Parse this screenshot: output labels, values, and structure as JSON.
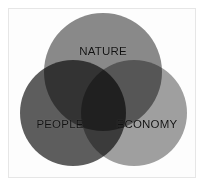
{
  "figure": {
    "background_color": "#ffffff",
    "frame_color": "#e6e6e6",
    "label_color": "#111111"
  },
  "chart_data": {
    "type": "venn",
    "title": "",
    "subtitle": "",
    "xlabel": "",
    "ylabel": "",
    "grid": false,
    "legend": "none",
    "set_count": 3,
    "blend_mode": "multiply",
    "sets": [
      {
        "id": "nature",
        "label": "NATURE",
        "color": "#8a8a8a",
        "cx": 103,
        "cy": 72,
        "r": 59,
        "label_x": 103,
        "label_y": 52
      },
      {
        "id": "people",
        "label": "PEOPLE",
        "color": "#5e5e5e",
        "cx": 73,
        "cy": 113,
        "r": 53,
        "label_x": 60,
        "label_y": 125
      },
      {
        "id": "economy",
        "label": "ECONOMY",
        "color": "#a0a0a0",
        "cx": 134,
        "cy": 113,
        "r": 53,
        "label_x": 147,
        "label_y": 125
      }
    ],
    "intersections": [
      {
        "id": "nature-people",
        "sets": [
          "nature",
          "people"
        ],
        "approx_color": "#3f3f3f"
      },
      {
        "id": "nature-economy",
        "sets": [
          "nature",
          "economy"
        ],
        "approx_color": "#575757"
      },
      {
        "id": "people-economy",
        "sets": [
          "people",
          "economy"
        ],
        "approx_color": "#3b3b3b"
      },
      {
        "id": "nature-people-economy",
        "sets": [
          "nature",
          "people",
          "economy"
        ],
        "approx_color": "#242424"
      }
    ]
  }
}
